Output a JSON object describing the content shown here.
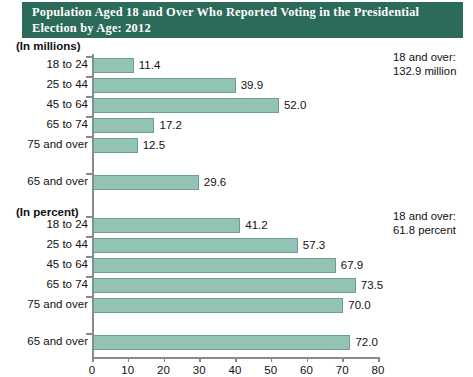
{
  "title": {
    "line1": "Population Aged 18 and Over Who Reported Voting in the Presidential",
    "line2": "Election by Age: 2012"
  },
  "sections": {
    "millions_header": "(In millions)",
    "percent_header": "(In percent)"
  },
  "annotations": {
    "millions": {
      "line1": "18 and over:",
      "line2": "132.9 million"
    },
    "percent": {
      "line1": "18 and over:",
      "line2": "61.8 percent"
    }
  },
  "colors": {
    "banner": "#2c6a59",
    "bar_fill": "#93c3b4",
    "bar_stroke": "#6f9e90",
    "axis": "#8a8a8a"
  },
  "chart_data": {
    "type": "bar",
    "title": "Population Aged 18 and Over Who Reported Voting in the Presidential Election by Age: 2012",
    "orientation": "horizontal",
    "xlabel": "",
    "ylabel": "",
    "xlim": [
      0,
      80
    ],
    "xticks": [
      0,
      10,
      20,
      30,
      40,
      50,
      60,
      70,
      80
    ],
    "grid": false,
    "legend": "none",
    "panels": [
      {
        "name": "millions",
        "unit_label": "(In millions)",
        "note": "18 and over: 132.9 million",
        "categories": [
          "18 to 24",
          "25 to 44",
          "45 to 64",
          "65 to 74",
          "75 and over",
          "65 and over"
        ],
        "values": [
          11.4,
          39.9,
          52.0,
          17.2,
          12.5,
          29.6
        ],
        "value_labels": [
          "11.4",
          "39.9",
          "52.0",
          "17.2",
          "12.5",
          "29.6"
        ]
      },
      {
        "name": "percent",
        "unit_label": "(In percent)",
        "note": "18 and over: 61.8 percent",
        "categories": [
          "18 to 24",
          "25 to 44",
          "45 to 64",
          "65 to 74",
          "75 and over",
          "65 and over"
        ],
        "values": [
          41.2,
          57.3,
          67.9,
          73.5,
          70.0,
          72.0
        ],
        "value_labels": [
          "41.2",
          "57.3",
          "67.9",
          "73.5",
          "70.0",
          "72.0"
        ]
      }
    ]
  }
}
